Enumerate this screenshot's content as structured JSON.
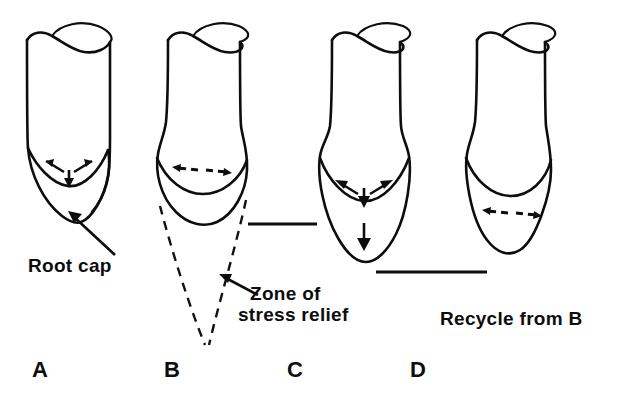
{
  "figure": {
    "background_color": "#ffffff",
    "line_color": "#0d0d0d",
    "panels": [
      {
        "letter": "A",
        "caption": "",
        "state": "intact root tip with V-shaped meristem and root cap",
        "arrows": [
          "up-left",
          "up-right",
          "down"
        ]
      },
      {
        "letter": "B",
        "caption": "",
        "state": "swollen tip, flattened boundary, root cap shed",
        "arrows": [
          "left",
          "right"
        ]
      },
      {
        "letter": "C",
        "caption": "",
        "state": "elongated regenerating root cap",
        "arrows": [
          "up-left",
          "up-right",
          "down",
          "down-long"
        ]
      },
      {
        "letter": "D",
        "caption": "Recycle from B",
        "state": "restored tip, cycle repeats",
        "arrows": [
          "left",
          "right"
        ]
      }
    ],
    "labels": {
      "root_cap": "Root cap",
      "zone_line1": "Zone of",
      "zone_line2": "stress relief",
      "recycle": "Recycle from B"
    }
  }
}
